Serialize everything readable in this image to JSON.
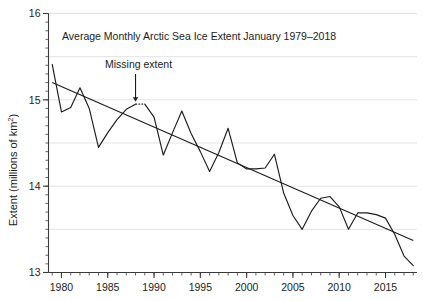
{
  "chart_data": {
    "type": "line",
    "title": "Average Monthly Arctic Sea Ice Extent January 1979–2018",
    "xlabel": "",
    "ylabel": "Extent (millions of km",
    "ylabel_sup": "2",
    "ylabel_tail": ")",
    "xlim": [
      1978.6,
      2018.4
    ],
    "ylim": [
      13,
      16
    ],
    "grid": true,
    "legend": false,
    "x_ticks_major": [
      1980,
      1985,
      1990,
      1995,
      2000,
      2005,
      2010,
      2015
    ],
    "x_tick_labels": [
      "1980",
      "1985",
      "1990",
      "1995",
      "2000",
      "2005",
      "2010",
      "2015"
    ],
    "x_tick_minor_step": 1,
    "y_ticks_major": [
      13,
      14,
      15,
      16
    ],
    "y_tick_labels": [
      "13",
      "14",
      "15",
      "16"
    ],
    "y_tick_minor_step": 0.1,
    "y_gridlines": [
      13.5,
      14,
      14.5,
      15,
      15.5,
      16
    ],
    "x": [
      1979,
      1980,
      1981,
      1982,
      1983,
      1984,
      1985,
      1986,
      1987,
      1988,
      1989,
      1990,
      1991,
      1992,
      1993,
      1994,
      1995,
      1996,
      1997,
      1998,
      1999,
      2000,
      2001,
      2002,
      2003,
      2004,
      2005,
      2006,
      2007,
      2008,
      2009,
      2010,
      2011,
      2012,
      2013,
      2014,
      2015,
      2016,
      2017,
      2018
    ],
    "values": [
      15.41,
      14.86,
      14.91,
      15.14,
      14.9,
      14.45,
      14.62,
      14.77,
      14.89,
      14.95,
      14.95,
      14.8,
      14.36,
      14.62,
      14.87,
      14.61,
      14.4,
      14.17,
      14.39,
      14.67,
      14.27,
      14.2,
      14.2,
      14.21,
      14.37,
      13.92,
      13.66,
      13.5,
      13.71,
      13.86,
      13.88,
      13.76,
      13.5,
      13.69,
      13.69,
      13.67,
      13.63,
      13.44,
      13.19,
      13.08
    ],
    "series_name": "Average monthly Arctic sea ice extent",
    "trend_line": {
      "name": "linear trend",
      "x": [
        1979,
        2018
      ],
      "y": [
        15.2,
        13.37
      ]
    },
    "missing_segment": {
      "label": "Missing extent",
      "x": [
        1988,
        1989
      ],
      "y": [
        14.95,
        14.95
      ],
      "arrow_x": 1988,
      "arrow_tip_y": 14.98,
      "arrow_tail_y": 15.3
    }
  }
}
